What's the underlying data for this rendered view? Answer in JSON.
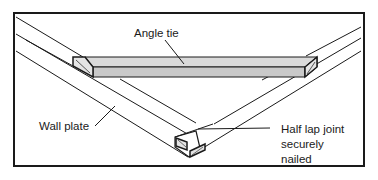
{
  "diagram": {
    "labels": {
      "angle_tie": "Angle tie",
      "wall_plate": "Wall plate",
      "half_lap_line1": "Half lap joint",
      "half_lap_line2": "securely",
      "half_lap_line3": "nailed"
    },
    "colors": {
      "stroke": "#1a1a1a",
      "tie_fill": "#d6d6d6",
      "tie_side": "#c4c4c4",
      "background": "#ffffff"
    }
  }
}
